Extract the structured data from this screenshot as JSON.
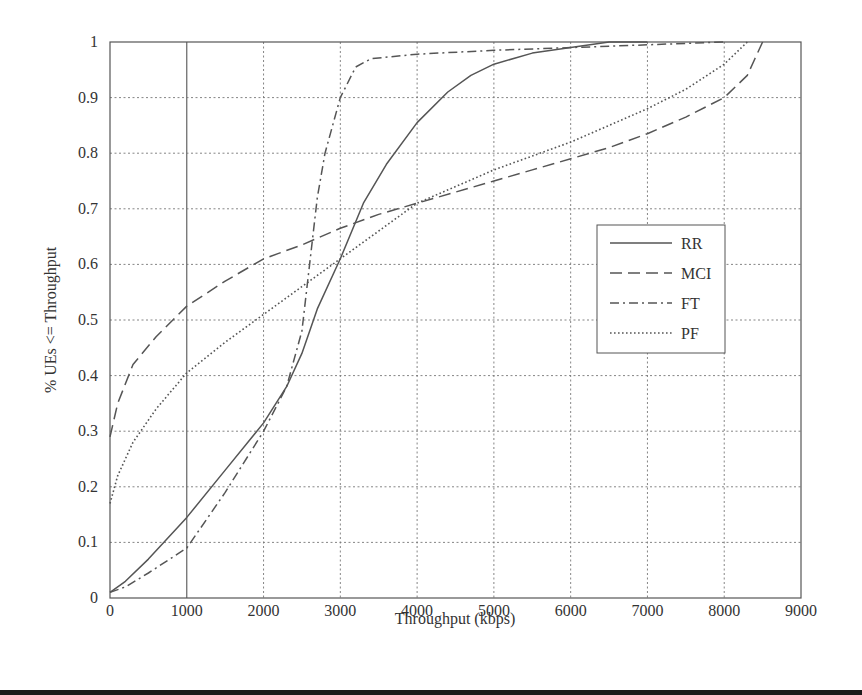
{
  "chart_data": {
    "type": "line",
    "title": "",
    "xlabel": "Throughput (kbps)",
    "ylabel": "% UEs <= Throughput",
    "xlim": [
      0,
      9000
    ],
    "ylim": [
      0,
      1
    ],
    "xticks": [
      0,
      1000,
      2000,
      3000,
      4000,
      5000,
      6000,
      7000,
      8000,
      9000
    ],
    "xtick_labels": [
      "0",
      "1000",
      "2000",
      "3000",
      "4000",
      "5000",
      "6000",
      "7000",
      "8000",
      "9000"
    ],
    "yticks": [
      0,
      0.1,
      0.2,
      0.3,
      0.4,
      0.5,
      0.6,
      0.7,
      0.8,
      0.9,
      1
    ],
    "ytick_labels": [
      "0",
      "0.1",
      "0.2",
      "0.3",
      "0.4",
      "0.5",
      "0.6",
      "0.7",
      "0.8",
      "0.9",
      "1"
    ],
    "grid": true,
    "legend_position": "center-right",
    "series": [
      {
        "name": "RR",
        "style": "solid",
        "x": [
          0,
          200,
          500,
          700,
          1000,
          1500,
          2000,
          2300,
          2500,
          2700,
          3000,
          3300,
          3600,
          4000,
          4400,
          4700,
          5000,
          5500,
          6000,
          6500,
          7000
        ],
        "y": [
          0.01,
          0.03,
          0.07,
          0.1,
          0.145,
          0.23,
          0.315,
          0.38,
          0.44,
          0.52,
          0.61,
          0.71,
          0.78,
          0.855,
          0.91,
          0.94,
          0.96,
          0.98,
          0.99,
          1.0,
          1.0
        ]
      },
      {
        "name": "MCI",
        "style": "dashed",
        "x": [
          0,
          100,
          300,
          600,
          1000,
          1500,
          2000,
          2500,
          3000,
          3500,
          4000,
          4500,
          5000,
          5500,
          6000,
          6500,
          7000,
          7500,
          8000,
          8300,
          8400,
          8500
        ],
        "y": [
          0.29,
          0.35,
          0.42,
          0.47,
          0.525,
          0.57,
          0.61,
          0.635,
          0.665,
          0.69,
          0.71,
          0.73,
          0.75,
          0.77,
          0.79,
          0.81,
          0.835,
          0.865,
          0.9,
          0.94,
          0.97,
          1.0
        ]
      },
      {
        "name": "FT",
        "style": "dashdot",
        "x": [
          0,
          200,
          500,
          1000,
          1500,
          2000,
          2300,
          2500,
          2600,
          2700,
          2800,
          3000,
          3200,
          3400,
          4000,
          5000,
          6000,
          7000,
          8000
        ],
        "y": [
          0.01,
          0.02,
          0.045,
          0.09,
          0.19,
          0.3,
          0.38,
          0.48,
          0.6,
          0.72,
          0.8,
          0.9,
          0.955,
          0.97,
          0.978,
          0.985,
          0.99,
          0.995,
          1.0
        ]
      },
      {
        "name": "PF",
        "style": "dotted",
        "x": [
          0,
          100,
          300,
          600,
          1000,
          1500,
          2000,
          2500,
          3000,
          3500,
          4000,
          4500,
          5000,
          5500,
          6000,
          6500,
          7000,
          7500,
          8000,
          8300
        ],
        "y": [
          0.17,
          0.22,
          0.28,
          0.34,
          0.405,
          0.46,
          0.51,
          0.56,
          0.61,
          0.66,
          0.71,
          0.74,
          0.77,
          0.795,
          0.82,
          0.85,
          0.88,
          0.915,
          0.96,
          1.0
        ]
      }
    ]
  },
  "legend": {
    "items": [
      "RR",
      "MCI",
      "FT",
      "PF"
    ]
  },
  "colors": {
    "line": "#555555",
    "grid": "#777777",
    "axis": "#555555"
  }
}
